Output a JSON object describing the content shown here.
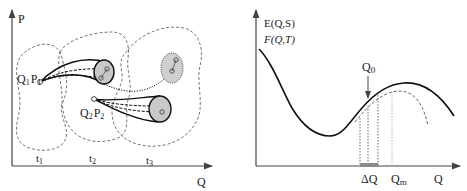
{
  "left_panel": {
    "axis_y_label": "P",
    "axis_x_label": "Q",
    "regions": [
      {
        "label": "t",
        "sub": "1"
      },
      {
        "label": "t",
        "sub": "2"
      },
      {
        "label": "t",
        "sub": "3"
      }
    ],
    "points": [
      {
        "q": "Q",
        "q_sub": "1",
        "p": "P",
        "p_sub": "1"
      },
      {
        "q": "Q",
        "q_sub": "2",
        "p": "P",
        "p_sub": "2"
      }
    ]
  },
  "right_panel": {
    "axis_y_labels": [
      "E(Q,S)",
      "F(Q,T)"
    ],
    "axis_x_label": "Q",
    "marker_q0": {
      "label": "Q",
      "sub": "0"
    },
    "delta_q": "ΔQ",
    "marker_qm": {
      "label": "Q",
      "sub": "m"
    }
  },
  "colors": {
    "line": "#111111",
    "dashed": "#555555",
    "ellipse_fill": "#c8c8c8",
    "axis": "#444444",
    "delta_bar": "#8a8a8a"
  }
}
